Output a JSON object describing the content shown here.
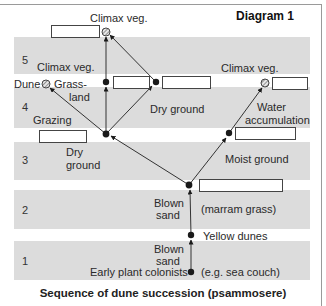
{
  "diagram": {
    "title": "Diagram 1",
    "caption": "Sequence of dune succession (psammosere)",
    "colors": {
      "band": "#dcdcdc",
      "node": "#1a1a1a",
      "line": "#333333"
    },
    "bands": [
      {
        "num": "5"
      },
      {
        "num": "4"
      },
      {
        "num": "3"
      },
      {
        "num": "2"
      },
      {
        "num": "1"
      }
    ],
    "labels": {
      "climax_top": "Climax veg.",
      "climax_left": "Climax veg.",
      "climax_right": "Climax veg.",
      "dune": "Dune",
      "grassland_1": "Grass-",
      "grassland_2": "land",
      "grazing": "Grazing",
      "dry_ground_upper": "Dry ground",
      "dry_ground_lower_1": "Dry",
      "dry_ground_lower_2": "ground",
      "water_1": "Water",
      "water_2": "accumulation",
      "moist_ground": "Moist ground",
      "blown_sand_2a": "Blown",
      "blown_sand_2b": "sand",
      "marram": "(marram grass)",
      "yellow_dunes": "Yellow dunes",
      "blown_sand_1a": "Blown",
      "blown_sand_1b": "sand",
      "early_colonists": "Early plant colonists",
      "sea_couch": "(e.g. sea couch)"
    },
    "blank_boxes": [
      "top-climax-box",
      "grassland-box",
      "dry-ground-box",
      "right-climax-box",
      "grazing-box",
      "water-accumulation-box",
      "branch-box"
    ]
  }
}
